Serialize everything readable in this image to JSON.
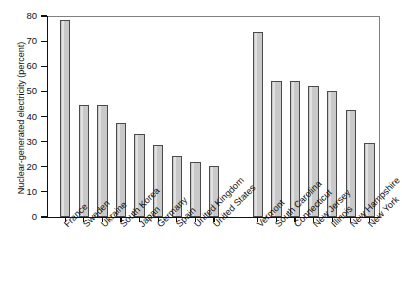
{
  "chart_data": {
    "type": "bar",
    "title": "",
    "xlabel": "",
    "ylabel": "Nuclear-generated electricity (percent)",
    "ylim": [
      0,
      80
    ],
    "yticks": [
      0,
      10,
      20,
      30,
      40,
      50,
      60,
      70,
      80
    ],
    "ytick_labels": [
      "0",
      "10",
      "20",
      "30",
      "40",
      "50",
      "60",
      "70",
      "80"
    ],
    "grid": false,
    "legend": "none",
    "groups": [
      {
        "name": "Countries",
        "categories": [
          "France",
          "Sweden",
          "Ukraine",
          "South Korea",
          "Japan",
          "Germany",
          "Spain",
          "United Kingdom",
          "United States"
        ],
        "values": [
          78.5,
          44.5,
          44.5,
          37.5,
          33.0,
          28.8,
          24.4,
          21.8,
          20.1
        ]
      },
      {
        "name": "U.S. states",
        "categories": [
          "Vermont",
          "South Carolina",
          "Connecticut",
          "New Jersey",
          "Illinois",
          "New Hampshire",
          "New York"
        ],
        "values": [
          73.5,
          54.2,
          54.2,
          52.1,
          50.0,
          42.6,
          29.4
        ]
      }
    ],
    "categories": [
      "France",
      "Sweden",
      "Ukraine",
      "South Korea",
      "Japan",
      "Germany",
      "Spain",
      "United Kingdom",
      "United States",
      "Vermont",
      "South Carolina",
      "Connecticut",
      "New Jersey",
      "Illinois",
      "New Hampshire",
      "New York"
    ],
    "values": [
      78.5,
      44.5,
      44.5,
      37.5,
      33.0,
      28.8,
      24.4,
      21.8,
      20.1,
      73.5,
      54.2,
      54.2,
      52.1,
      50.0,
      42.6,
      29.4
    ],
    "bar_color": "#c9c9c9",
    "bar_edge_color": "#4a4a4a",
    "axis_color": "#111111",
    "frame_color": "#808080"
  }
}
